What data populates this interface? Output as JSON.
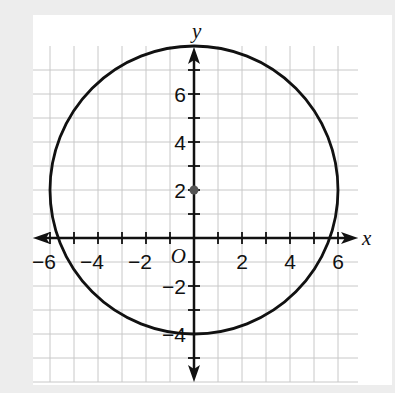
{
  "chart_data": {
    "type": "scatter",
    "title": "",
    "xlabel": "x",
    "ylabel": "y",
    "origin_label": "O",
    "xlim": [
      -6.5,
      6.5
    ],
    "ylim": [
      -6,
      8
    ],
    "grid": true,
    "grid_step": 1,
    "x_tick_labels": [
      "-6",
      "-4",
      "-2",
      "2",
      "4",
      "6"
    ],
    "x_tick_values": [
      -6,
      -4,
      -2,
      2,
      4,
      6
    ],
    "y_tick_labels": [
      "6",
      "4",
      "2",
      "-2",
      "-4"
    ],
    "y_tick_values": [
      6,
      4,
      2,
      -2,
      -4
    ],
    "shapes": [
      {
        "kind": "circle",
        "center": [
          0,
          2
        ],
        "radius": 6,
        "equation": "x^2 + (y-2)^2 = 36"
      }
    ],
    "points": [
      {
        "name": "center",
        "x": 0,
        "y": 2
      }
    ],
    "intercepts": {
      "x": [
        -5.66,
        5.66
      ],
      "y": [
        8,
        -4
      ]
    }
  },
  "colors": {
    "background": "#ededed",
    "panel": "#ffffff",
    "grid": "#c8c8c8",
    "axis": "#111111",
    "curve": "#111111",
    "center_point": "#555555"
  }
}
